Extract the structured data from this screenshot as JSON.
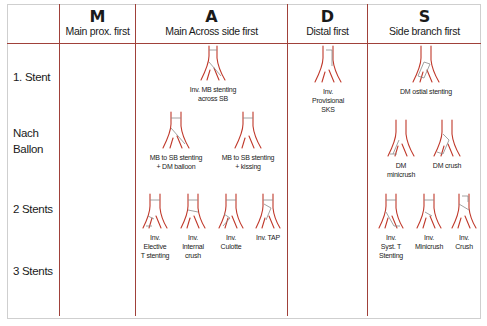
{
  "columns": [
    {
      "letter": "M",
      "subtitle": "Main prox. first"
    },
    {
      "letter": "A",
      "subtitle": "Main Across side first"
    },
    {
      "letter": "D",
      "subtitle": "Distal first"
    },
    {
      "letter": "S",
      "subtitle": "Side branch first"
    }
  ],
  "rows": [
    {
      "label": "1. Stent"
    },
    {
      "label": "Nach\nBallon"
    },
    {
      "label": "2 Stents"
    },
    {
      "label": "3 Stents"
    }
  ],
  "figures": {
    "a_row1": "Inv. MB stenting\nacross SB",
    "a_row2_1": "MB to SB stenting\n+ DM balloon",
    "a_row2_2": "MB to SB stenting\n+ kissing",
    "a_row3_1": "Inv.\nElective\nT stenting",
    "a_row3_2": "Inv.\nInternal\ncrush",
    "a_row3_3": "Inv.\nCulotte",
    "a_row3_4": "Inv. TAP",
    "d_row1": "Inv.\nProvisional\nSKS",
    "s_row1": "DM ostial stenting",
    "s_row2_1": "DM\nminicrush",
    "s_row2_2": "DM crush",
    "s_row3_1": "Inv.\nSyst. T\nStenting",
    "s_row3_2": "Inv.\nMinicrush",
    "s_row3_3": "Inv.\nCrush"
  },
  "colors": {
    "grid_line": "#a0413a",
    "vessel": "#c0392b",
    "border": "#cfcfcf"
  }
}
